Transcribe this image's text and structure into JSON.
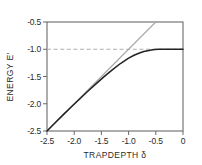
{
  "chart_data": {
    "type": "line",
    "title": "",
    "xlabel": "TRAPDEPTH δ",
    "ylabel": "ENERGY E'",
    "xlim": [
      -2.5,
      0.0
    ],
    "ylim": [
      -2.5,
      -0.5
    ],
    "grid": false,
    "legend_position": "none",
    "xticks": [
      -2.5,
      -2.0,
      -1.5,
      -1.0,
      -0.5,
      0.0
    ],
    "xtick_labels": [
      "-2.5",
      "-2.0",
      "-1.5",
      "-1.0",
      "-0.5",
      "0"
    ],
    "yticks": [
      -2.5,
      -2.0,
      -1.5,
      -1.0,
      -0.5
    ],
    "ytick_labels": [
      "-2.5",
      "-2.0",
      "-1.5",
      "-1.0",
      "-0.5"
    ],
    "series": [
      {
        "name": "reference-line",
        "style": "solid",
        "color": "#a8a8a8",
        "width": 1.1,
        "x": [
          -2.5,
          -2.0,
          -1.5,
          -1.0,
          -0.5
        ],
        "values": [
          -2.5,
          -2.0,
          -1.5,
          -1.0,
          -0.5
        ]
      },
      {
        "name": "bound-state-energy",
        "style": "solid",
        "color": "#222222",
        "width": 1.5,
        "x": [
          -2.5,
          -2.35,
          -2.2,
          -2.05,
          -1.9,
          -1.75,
          -1.6,
          -1.45,
          -1.3,
          -1.15,
          -1.0,
          -0.9,
          -0.8,
          -0.72,
          -0.65,
          -0.58,
          -0.52,
          -0.45,
          -0.35,
          -0.2,
          0.0
        ],
        "values": [
          -2.5,
          -2.35,
          -2.2,
          -2.055,
          -1.912,
          -1.772,
          -1.635,
          -1.503,
          -1.378,
          -1.262,
          -1.162,
          -1.11,
          -1.068,
          -1.043,
          -1.027,
          -1.014,
          -1.006,
          -1.0,
          -1.0,
          -1.0,
          -1.0
        ]
      },
      {
        "name": "asymptote-line",
        "style": "dashed",
        "color": "#b0b0b0",
        "width": 1.1,
        "x": [
          -2.5,
          0.0
        ],
        "values": [
          -1.0,
          -1.0
        ]
      }
    ]
  },
  "axes": {
    "frame_color": "#6a6a6a",
    "tick_color": "#6a6a6a"
  }
}
